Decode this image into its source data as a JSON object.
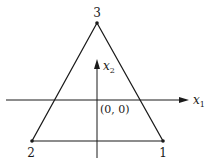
{
  "diagram": {
    "type": "triangle-element",
    "vertices": [
      {
        "id": "1",
        "label": "1"
      },
      {
        "id": "2",
        "label": "2"
      },
      {
        "id": "3",
        "label": "3"
      }
    ],
    "axes": {
      "x": {
        "name": "x",
        "subscript": "1"
      },
      "y": {
        "name": "x",
        "subscript": "2"
      }
    },
    "origin_label": "(0, 0)",
    "colors": {
      "line": "#1a1a1a",
      "background": "#ffffff"
    }
  }
}
